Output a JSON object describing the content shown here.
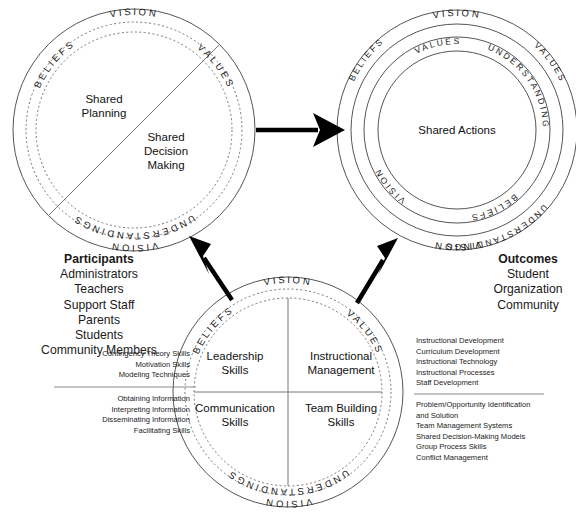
{
  "figure": {
    "top_caption": "",
    "circles": {
      "planning": {
        "name": "shared-planning-circle",
        "ring_words": [
          "VISION",
          "VALUES",
          "UNDERSTANDINGS",
          "BELIEFS"
        ],
        "outer_top_word": "VISION",
        "outer_bottom_word": "VISION",
        "inner_words": [
          "BELIEFS",
          "VALUES",
          "UNDERSTANDINGS"
        ],
        "segments": [
          {
            "label_line1": "Shared",
            "label_line2": "Planning",
            "label_line3": ""
          },
          {
            "label_line1": "Shared",
            "label_line2": "Decision",
            "label_line3": "Making"
          }
        ]
      },
      "actions": {
        "name": "shared-actions-circle",
        "center_label": "Shared Actions",
        "outer_ring_words": [
          "VISION",
          "VALUES",
          "UNDERSTANDINGS",
          "BELIEFS",
          "VISION"
        ],
        "inner_ring_words": [
          "VALUES",
          "UNDERSTANDINGS",
          "BELIEFS",
          "VISION"
        ]
      },
      "skills": {
        "name": "skills-circle",
        "ring_words": [
          "VISION",
          "VALUES",
          "UNDERSTANDINGS",
          "BELIEFS",
          "VISION"
        ],
        "quadrants": [
          {
            "line1": "Leadership",
            "line2": "Skills"
          },
          {
            "line1": "Instructional",
            "line2": "Management"
          },
          {
            "line1": "Communication",
            "line2": "Skills"
          },
          {
            "line1": "Team Building",
            "line2": "Skills"
          }
        ]
      }
    },
    "participants": {
      "title": "Participants",
      "items": [
        "Administrators",
        "Teachers",
        "Support Staff",
        "Parents",
        "Students",
        "Community Members"
      ]
    },
    "outcomes": {
      "title": "Outcomes",
      "items": [
        "Student",
        "Organization",
        "Community"
      ]
    },
    "leadership_skills_list": [
      "Contingency Theory Skills",
      "Motivation Skills",
      "Modeling Techniques"
    ],
    "communication_skills_list": [
      "Obtaining Information",
      "Interpreting Information",
      "Disseminating Information",
      "Facilitating Skills"
    ],
    "instructional_management_list": [
      "Instructional Development",
      "Curriculum Development",
      "Instructional Technology",
      "Instructional Processes",
      "Staff Development"
    ],
    "team_building_list": [
      "Problem/Opportunity Identification",
      " and Solution",
      "Team Management Systems",
      "Shared Decision-Making Models",
      "Group Process Skills",
      "Conflict Management"
    ],
    "arrows": [
      {
        "name": "arrow-planning-to-actions",
        "from": "shared-planning-circle",
        "to": "shared-actions-circle"
      },
      {
        "name": "arrow-skills-to-planning",
        "from": "skills-circle",
        "to": "shared-planning-circle"
      },
      {
        "name": "arrow-skills-to-actions",
        "from": "skills-circle",
        "to": "shared-actions-circle"
      }
    ],
    "colors": {
      "ink": "#1a1a1a",
      "ring_stroke": "#555555",
      "dashed_stroke": "#777777",
      "arrow": "#000000",
      "background": "#ffffff"
    }
  }
}
